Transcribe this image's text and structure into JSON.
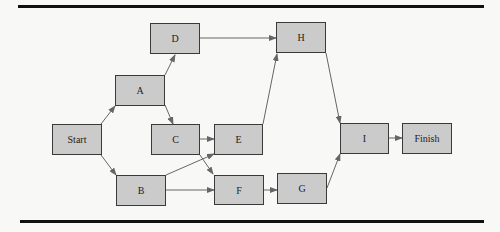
{
  "diagram": {
    "type": "activity-network",
    "nodes": [
      {
        "id": "start",
        "label": "Start",
        "x": 52,
        "y": 124,
        "w": 50,
        "h": 31
      },
      {
        "id": "a",
        "label": "A",
        "x": 115,
        "y": 75,
        "w": 50,
        "h": 31
      },
      {
        "id": "b",
        "label": "B",
        "x": 116,
        "y": 175,
        "w": 50,
        "h": 31
      },
      {
        "id": "c",
        "label": "C",
        "x": 151,
        "y": 124,
        "w": 49,
        "h": 31
      },
      {
        "id": "d",
        "label": "D",
        "x": 150,
        "y": 23,
        "w": 50,
        "h": 31
      },
      {
        "id": "e",
        "label": "E",
        "x": 214,
        "y": 124,
        "w": 49,
        "h": 31
      },
      {
        "id": "f",
        "label": "F",
        "x": 214,
        "y": 175,
        "w": 50,
        "h": 30
      },
      {
        "id": "g",
        "label": "G",
        "x": 277,
        "y": 173,
        "w": 50,
        "h": 31
      },
      {
        "id": "h",
        "label": "H",
        "x": 276,
        "y": 22,
        "w": 50,
        "h": 31
      },
      {
        "id": "i",
        "label": "I",
        "x": 340,
        "y": 123,
        "w": 49,
        "h": 31
      },
      {
        "id": "finish",
        "label": "Finish",
        "x": 402,
        "y": 123,
        "w": 50,
        "h": 31
      }
    ],
    "edges": [
      {
        "from": "Start",
        "to": "A"
      },
      {
        "from": "Start",
        "to": "B"
      },
      {
        "from": "A",
        "to": "D"
      },
      {
        "from": "A",
        "to": "C"
      },
      {
        "from": "D",
        "to": "H"
      },
      {
        "from": "C",
        "to": "E"
      },
      {
        "from": "C",
        "to": "F"
      },
      {
        "from": "B",
        "to": "E"
      },
      {
        "from": "B",
        "to": "F"
      },
      {
        "from": "E",
        "to": "H"
      },
      {
        "from": "F",
        "to": "G"
      },
      {
        "from": "H",
        "to": "I"
      },
      {
        "from": "G",
        "to": "I"
      },
      {
        "from": "I",
        "to": "Finish"
      }
    ],
    "colors": {
      "node_fill": "#cbcbcb",
      "node_border": "#3a3a3a",
      "edge": "#666666",
      "rule": "#111111"
    }
  }
}
